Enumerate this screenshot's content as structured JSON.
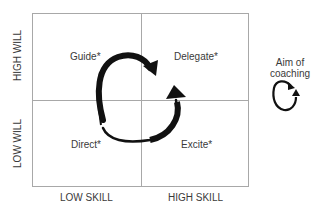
{
  "diagram": {
    "type": "quadrant-matrix",
    "axes": {
      "y_high": "HIGH WILL",
      "y_low": "LOW WILL",
      "x_low": "LOW SKILL",
      "x_high": "HIGH SKILL"
    },
    "quadrants": {
      "top_left": "Guide*",
      "top_right": "Delegate*",
      "bottom_left": "Direct*",
      "bottom_right": "Excite*"
    },
    "aside": {
      "line1": "Aim of",
      "line2": "coaching"
    },
    "colors": {
      "grid_line": "#a8a8a8",
      "arrow": "#111111",
      "text": "#3a3a3a"
    }
  }
}
